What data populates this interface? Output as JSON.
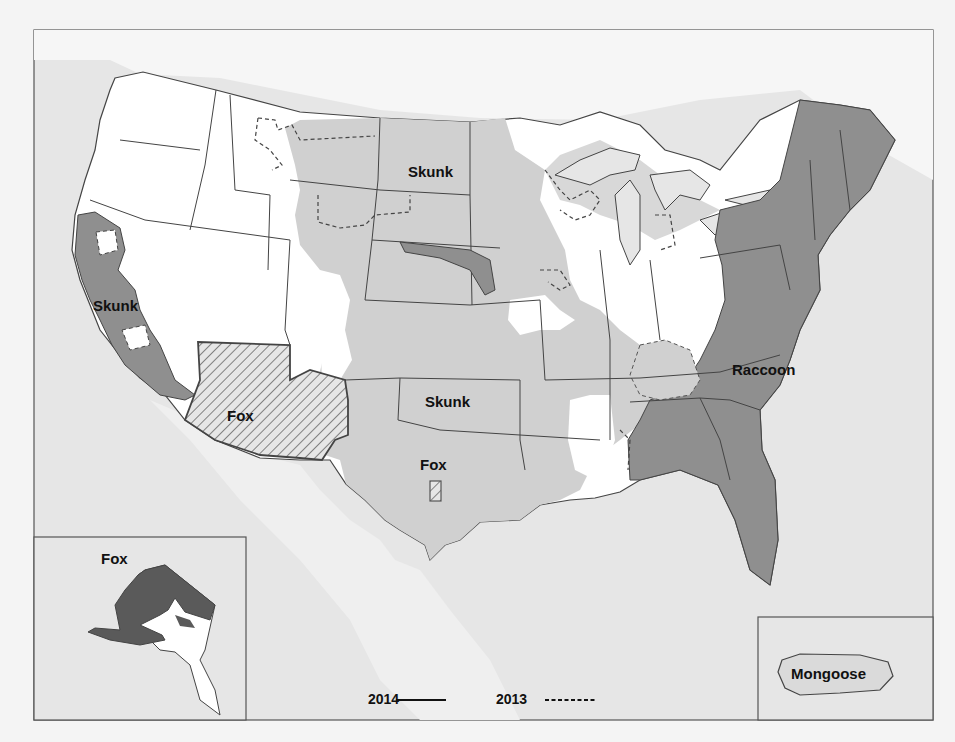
{
  "map": {
    "title": "Rabies reservoir distribution — United States",
    "colors": {
      "ocean": "#e4e4e4",
      "land_unaffected": "#ffffff",
      "skunk": "#cfcfcf",
      "raccoon": "#8f8f8f",
      "fox_dark": "#5a5a5a",
      "border": "#444444"
    },
    "region_labels": [
      {
        "id": "skunk-north-central",
        "text": "Skunk"
      },
      {
        "id": "skunk-california",
        "text": "Skunk"
      },
      {
        "id": "skunk-south-central",
        "text": "Skunk"
      },
      {
        "id": "fox-arizona",
        "text": "Fox"
      },
      {
        "id": "fox-texas",
        "text": "Fox"
      },
      {
        "id": "raccoon-east",
        "text": "Raccoon"
      }
    ],
    "insets": {
      "alaska": {
        "label": "Fox"
      },
      "puerto_rico": {
        "label": "Mongoose"
      }
    },
    "legend": {
      "items": [
        {
          "year": "2014",
          "line_style": "solid"
        },
        {
          "year": "2013",
          "line_style": "dashed"
        }
      ]
    }
  }
}
